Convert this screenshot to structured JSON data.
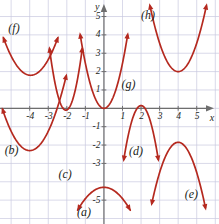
{
  "figure": {
    "title": "",
    "axis_labels": {
      "x": "x",
      "y": "y"
    },
    "curve_color": "#b5291f",
    "grid_color": "#c9c9e0",
    "axis_color": "#6e6e6e",
    "text_color": "#231f20",
    "background": "#ffffff"
  },
  "chart_data": {
    "type": "line",
    "title": "",
    "xlabel": "x",
    "ylabel": "y",
    "xlim": [
      -5.6,
      6.2
    ],
    "ylim": [
      -6.3,
      5.9
    ],
    "grid": true,
    "grid_step": 1,
    "legend_position": "inline-annotations",
    "xticks": [
      -4,
      -3,
      -2,
      -1,
      1,
      2,
      3,
      4,
      5
    ],
    "xtick_labels": [
      "-4",
      "-3",
      "-2",
      "-1",
      "1",
      "2",
      "3",
      "4",
      "5"
    ],
    "yticks": [
      5,
      4,
      3,
      2,
      1,
      -1,
      -2,
      -3,
      -5
    ],
    "ytick_labels": [
      "5",
      "4",
      "3",
      "2",
      "1",
      "-1",
      "-2",
      "-3",
      "-5"
    ],
    "series": [
      {
        "name": "(a)",
        "label": "(a)",
        "shape": "parabola",
        "opens": "down",
        "vertex": [
          0,
          -4.3
        ],
        "a": -0.62,
        "x_start": -1.45,
        "x_end": 1.45,
        "arrows": [
          "start",
          "end"
        ],
        "label_pos": [
          -1.45,
          -5.65
        ]
      },
      {
        "name": "(b)",
        "label": "(b)",
        "shape": "parabola",
        "opens": "up",
        "vertex": [
          -4,
          -2.3
        ],
        "a": 1.05,
        "x_start": -5.5,
        "x_end": -2.0,
        "arrows": [
          "start",
          "end"
        ],
        "label_pos": [
          -5.35,
          -2.25
        ]
      },
      {
        "name": "(c)",
        "label": "(c)",
        "shape": "parabola",
        "opens": "up",
        "vertex": [
          -2.05,
          -0.1
        ],
        "a": 4.3,
        "x_start": -2.95,
        "x_end": -1.15,
        "arrows": [
          "start",
          "end"
        ],
        "label_pos": [
          -2.45,
          -3.55
        ]
      },
      {
        "name": "(d)",
        "label": "(d)",
        "shape": "parabola",
        "opens": "down",
        "vertex": [
          2,
          0.15
        ],
        "a": -3.4,
        "x_start": 1.05,
        "x_end": 2.95,
        "arrows": [
          "start",
          "end"
        ],
        "label_pos": [
          1.35,
          -2.35
        ]
      },
      {
        "name": "(e)",
        "label": "(e)",
        "shape": "parabola",
        "opens": "down",
        "vertex": [
          4,
          -1.85
        ],
        "a": -1.65,
        "x_start": 2.55,
        "x_end": 5.5,
        "arrows": [
          "start",
          "end"
        ],
        "label_pos": [
          4.35,
          -4.65
        ]
      },
      {
        "name": "(f)",
        "label": "(f)",
        "shape": "parabola",
        "opens": "up",
        "vertex": [
          -3.95,
          1.8
        ],
        "a": 0.95,
        "x_start": -5.45,
        "x_end": -2.45,
        "arrows": [
          "start",
          "end"
        ],
        "label_pos": [
          -5.15,
          4.35
        ]
      },
      {
        "name": "(g)",
        "label": "(g)",
        "shape": "parabola",
        "opens": "up",
        "vertex": [
          0,
          0
        ],
        "a": 2.45,
        "x_start": -1.3,
        "x_end": 1.3,
        "arrows": [
          "start",
          "end"
        ],
        "label_pos": [
          0.95,
          1.35
        ]
      },
      {
        "name": "(h)",
        "label": "(h)",
        "shape": "parabola",
        "opens": "up",
        "vertex": [
          4,
          2
        ],
        "a": 1.55,
        "x_start": 2.45,
        "x_end": 5.55,
        "arrows": [
          "start",
          "end"
        ],
        "label_pos": [
          2.0,
          5.1
        ]
      }
    ]
  }
}
